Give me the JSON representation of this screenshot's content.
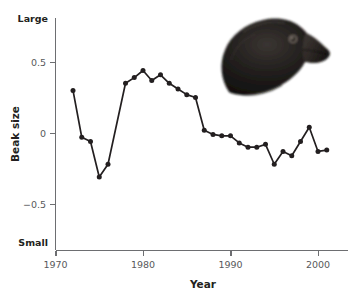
{
  "figure": {
    "background_color": "#ffffff",
    "ink_color": "#231f20",
    "axis_color": "#6d6e71"
  },
  "axes": {
    "x": {
      "title": "Year",
      "ticks": [
        {
          "value": 1970,
          "label": "1970"
        },
        {
          "value": 1980,
          "label": "1980"
        },
        {
          "value": 1990,
          "label": "1990"
        },
        {
          "value": 2000,
          "label": "2000"
        }
      ],
      "range": [
        1970,
        2004
      ]
    },
    "y": {
      "title": "Beak size",
      "ticks": [
        {
          "value": 0.5,
          "label": "0.5"
        },
        {
          "value": 0.0,
          "label": "0"
        },
        {
          "value": -0.5,
          "label": "−0.5"
        }
      ],
      "top_label": "Large",
      "bottom_label": "Small",
      "range": [
        -0.85,
        0.87
      ]
    }
  },
  "photo": {
    "name": "darwin-finch-head-photo",
    "subject": "medium ground finch head in profile facing right",
    "body_color": "#1c1a19",
    "beak_color": "#3a3431",
    "eye_color": "#2b2522",
    "eye_ring_color": "#8a7f75"
  },
  "chart_data": {
    "type": "line",
    "title": "",
    "xlabel": "Year",
    "ylabel": "Beak size",
    "xlim": [
      1970,
      2004
    ],
    "ylim": [
      -0.85,
      0.87
    ],
    "grid": false,
    "legend": false,
    "y_axis_endpoint_labels": {
      "high": "Large",
      "low": "Small"
    },
    "series": [
      {
        "name": "Beak size",
        "marker": "filled-circle",
        "x": [
          1972,
          1973,
          1974,
          1975,
          1976,
          1978,
          1979,
          1980,
          1981,
          1982,
          1983,
          1984,
          1985,
          1986,
          1987,
          1988,
          1989,
          1990,
          1991,
          1992,
          1993,
          1994,
          1995,
          1996,
          1997,
          1998,
          1999,
          2000,
          2001
        ],
        "values": [
          0.3,
          -0.03,
          -0.06,
          -0.31,
          -0.22,
          0.35,
          0.39,
          0.44,
          0.37,
          0.41,
          0.35,
          0.31,
          0.27,
          0.25,
          0.02,
          -0.01,
          -0.02,
          -0.02,
          -0.07,
          -0.1,
          -0.1,
          -0.08,
          -0.22,
          -0.13,
          -0.16,
          -0.06,
          0.04,
          -0.13,
          -0.12
        ]
      }
    ]
  }
}
